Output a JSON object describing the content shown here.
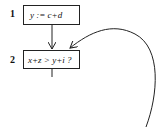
{
  "diagram": {
    "type": "flowchart",
    "nodes": [
      {
        "id": 1,
        "label": "1",
        "text": "y := c+d"
      },
      {
        "id": 2,
        "label": "2",
        "text": "x+z > y+i ?"
      }
    ],
    "edges": [
      {
        "from": 1,
        "to": 2,
        "style": "straight"
      },
      {
        "from": "loop-back",
        "to": 2,
        "style": "curved"
      },
      {
        "from": 2,
        "to": "continues-below",
        "style": "straight"
      }
    ]
  }
}
